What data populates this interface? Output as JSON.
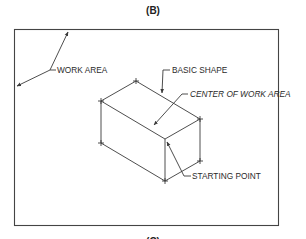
{
  "figure": {
    "title": "(B)",
    "next_caption": "(C)"
  },
  "labels": {
    "work_area": "WORK AREA",
    "basic_shape": "BASIC SHAPE",
    "center": "CENTER OF WORK AREA",
    "starting_point": "STARTING POINT"
  },
  "colors": {
    "line": "#3a3a3a",
    "text": "#2a2a2a",
    "background": "#ffffff"
  }
}
